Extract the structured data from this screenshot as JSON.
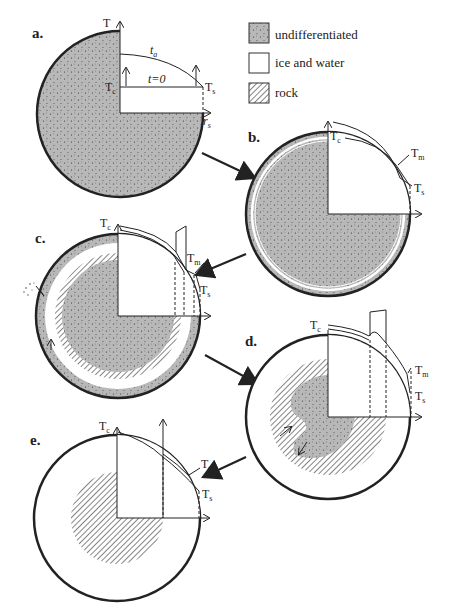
{
  "legend": {
    "items": [
      {
        "key": "undifferentiated",
        "label": "undifferentiated",
        "fill": "stipple-gray"
      },
      {
        "key": "ice",
        "label": "ice and water",
        "fill": "#ffffff"
      },
      {
        "key": "rock",
        "label": "rock",
        "fill": "hatch"
      }
    ]
  },
  "panels": {
    "a": {
      "label": "a.",
      "T_axis": "T",
      "Tc": "T",
      "Tc_sub": "c",
      "Ts": "T",
      "Ts_sub": "s",
      "ta": "t",
      "ta_sub": "a",
      "t0": "t=0",
      "rs": "r",
      "rs_sub": "s"
    },
    "b": {
      "label": "b.",
      "Tc": "T",
      "Tc_sub": "c",
      "Tm": "T",
      "Tm_sub": "m",
      "Ts": "T",
      "Ts_sub": "s"
    },
    "c": {
      "label": "c.",
      "Tc": "T",
      "Tc_sub": "c",
      "Tm": "T",
      "Tm_sub": "m",
      "Ts": "T",
      "Ts_sub": "s"
    },
    "d": {
      "label": "d.",
      "Tc": "T",
      "Tc_sub": "c",
      "Tm": "T",
      "Tm_sub": "m",
      "Ts": "T",
      "Ts_sub": "s"
    },
    "e": {
      "label": "e.",
      "Tc": "T",
      "Tc_sub": "c",
      "Tm": "T",
      "Tm_sub": "m",
      "Ts": "T",
      "Ts_sub": "s"
    }
  },
  "colors": {
    "undifferentiated": "#b4b4b4",
    "stroke": "#222222",
    "background": "#ffffff"
  }
}
